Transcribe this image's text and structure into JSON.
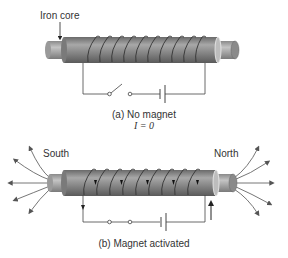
{
  "figure": {
    "panel_a": {
      "label_core": "Iron core",
      "caption": "(a) No magnet",
      "current_label": "I = 0",
      "switch_state": "open"
    },
    "panel_b": {
      "label_south": "South",
      "label_north": "North",
      "caption": "(b) Magnet activated",
      "switch_state": "closed"
    },
    "colors": {
      "core": "#8a8a8a",
      "core_dark": "#5e5e5e",
      "core_light": "#b8b8b8",
      "wire": "#3a3a3a",
      "text": "#333333"
    }
  }
}
